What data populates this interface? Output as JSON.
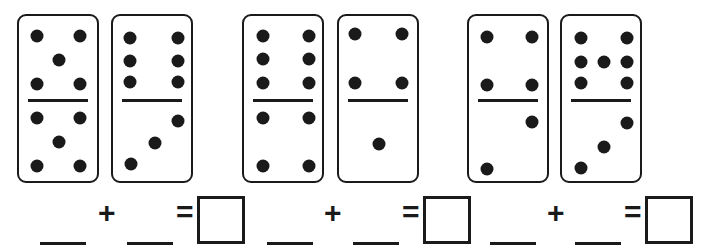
{
  "worksheet": {
    "dominoes": [
      {
        "top": 5,
        "bottom": 5
      },
      {
        "top": 6,
        "bottom": 3
      },
      {
        "top": 6,
        "bottom": 4
      },
      {
        "top": 4,
        "bottom": 1
      },
      {
        "top": 4,
        "bottom": 2
      },
      {
        "top": 7,
        "bottom": 3
      }
    ],
    "equations": [
      {
        "plus": "+",
        "equals": "=",
        "addend1": "",
        "addend2": "",
        "sum": ""
      },
      {
        "plus": "+",
        "equals": "=",
        "addend1": "",
        "addend2": "",
        "sum": ""
      },
      {
        "plus": "+",
        "equals": "=",
        "addend1": "",
        "addend2": "",
        "sum": ""
      }
    ],
    "colors": {
      "ink": "#1a1a1a",
      "background": "#ffffff"
    }
  }
}
